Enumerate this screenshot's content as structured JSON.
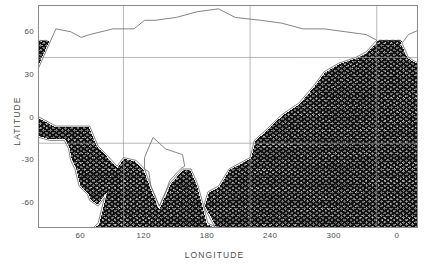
{
  "figure": {
    "type": "ground-track-map",
    "background": "#ffffff",
    "frame_color": "#8a8a8a",
    "text_color": "#4d4d4d"
  },
  "axes": {
    "xlabel": "LONGITUDE",
    "ylabel": "LATITUDE"
  },
  "chart_data": {
    "type": "scatter",
    "title": "",
    "subtitle": "",
    "xlabel": "LONGITUDE",
    "ylabel": "LATITUDE",
    "xlim": [
      20,
      380
    ],
    "ylim": [
      -78,
      78
    ],
    "xticks": [
      60,
      120,
      180,
      240,
      300,
      0
    ],
    "xtick_values": [
      60,
      120,
      180,
      240,
      300,
      360
    ],
    "xtick_labels": [
      "60",
      "120",
      "180",
      "240",
      "300",
      "0"
    ],
    "yticks": [
      60,
      30,
      0,
      -30,
      -60
    ],
    "ytick_labels": [
      "60",
      "30",
      "0",
      "-30",
      "-60"
    ],
    "grid": true,
    "grid_color": "#b9b9b9",
    "legend": "none",
    "projection": "cylindrical-equidistant",
    "series": [
      {
        "name": "ascending-tracks",
        "color": "#1a1a1a",
        "inclination_deg": 66,
        "direction": "ascending",
        "count": 127,
        "track_spacing_deg_lon": 2.83
      },
      {
        "name": "descending-tracks",
        "color": "#1a1a1a",
        "inclination_deg": -66,
        "direction": "descending",
        "count": 127,
        "track_spacing_deg_lon": 2.83
      }
    ],
    "coverage": {
      "lat_min": -66,
      "lat_max": 66,
      "lon_min": 0,
      "lon_max": 360
    },
    "annotations": []
  },
  "ticks": {
    "x": [
      {
        "label": "60",
        "value": 60
      },
      {
        "label": "120",
        "value": 120
      },
      {
        "label": "180",
        "value": 180
      },
      {
        "label": "240",
        "value": 240
      },
      {
        "label": "300",
        "value": 300
      },
      {
        "label": "0",
        "value": 360
      }
    ],
    "y": [
      {
        "label": "60",
        "value": 60
      },
      {
        "label": "30",
        "value": 30
      },
      {
        "label": "0",
        "value": 0
      },
      {
        "label": "-30",
        "value": -30
      },
      {
        "label": "-60",
        "value": -60
      }
    ]
  }
}
